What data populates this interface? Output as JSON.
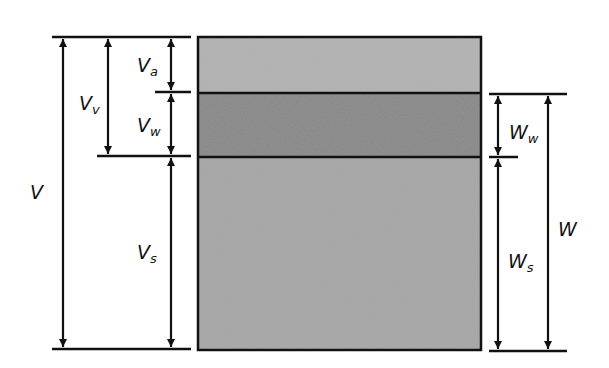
{
  "diagram": {
    "type": "soil phase diagram",
    "colors": {
      "air": "#b2b2b2",
      "water": "#878787",
      "solids": "#a6a6a6",
      "line": "#111111"
    },
    "phases": [
      {
        "name": "air"
      },
      {
        "name": "water"
      },
      {
        "name": "solids"
      }
    ],
    "left_labels": {
      "V": {
        "main": "V",
        "sub": ""
      },
      "Vv": {
        "main": "V",
        "sub": "v"
      },
      "Va": {
        "main": "V",
        "sub": "a"
      },
      "Vw": {
        "main": "V",
        "sub": "w"
      },
      "Vs": {
        "main": "V",
        "sub": "s"
      }
    },
    "right_labels": {
      "Ww": {
        "main": "W",
        "sub": "w"
      },
      "Ws": {
        "main": "W",
        "sub": "s"
      },
      "W": {
        "main": "W",
        "sub": ""
      }
    }
  }
}
